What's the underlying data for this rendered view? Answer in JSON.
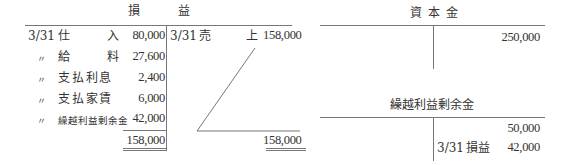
{
  "pl_account": {
    "title_left": "損",
    "title_right": "益",
    "debit": [
      {
        "date": "3/31",
        "item_a": "仕",
        "item_b": "入",
        "amount": "80,000"
      },
      {
        "date": "〃",
        "item_a": "給",
        "item_b": "料",
        "amount": "27,600"
      },
      {
        "date": "〃",
        "item": "支 払 利 息",
        "amount": "2,400"
      },
      {
        "date": "〃",
        "item": "支 払 家 賃",
        "amount": "6,000"
      },
      {
        "date": "〃",
        "item": "繰越利益剰余金",
        "amount": "42,000"
      }
    ],
    "debit_total": "158,000",
    "credit": [
      {
        "date": "3/31",
        "item_a": "売",
        "item_b": "上",
        "amount": "158,000"
      }
    ],
    "credit_total": "158,000"
  },
  "capital_account": {
    "title": "資 本 金",
    "credit": [
      {
        "amount": "250,000"
      }
    ]
  },
  "retained_earnings_account": {
    "title": "繰越利益剰余金",
    "credit": [
      {
        "date": "",
        "item": "",
        "amount": "50,000"
      },
      {
        "date": "3/31",
        "item": "損益",
        "amount": "42,000"
      }
    ]
  }
}
